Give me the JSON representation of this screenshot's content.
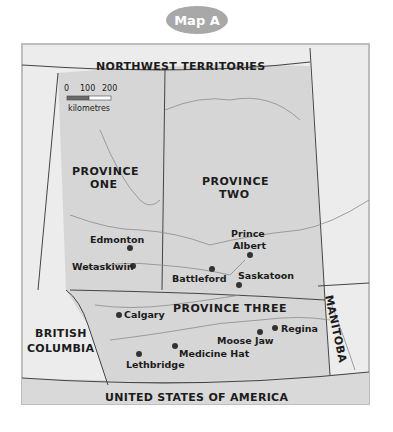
{
  "title": "Map A",
  "colors": {
    "badge": "#a8a8a8",
    "province_fill": "#d6d6d6",
    "outside_fill": "#ececec",
    "border": "#444444",
    "river": "#8a8a8a",
    "city_dot": "#333333"
  },
  "scale_bar": {
    "ticks": [
      "0",
      "100",
      "200"
    ],
    "unit": "kilometres"
  },
  "regions": {
    "north": "NORTHWEST TERRITORIES",
    "west_line1": "BRITISH",
    "west_line2": "COLUMBIA",
    "east": "MANITOBA",
    "south": "UNITED STATES OF AMERICA"
  },
  "provinces": {
    "one_line1": "PROVINCE",
    "one_line2": "ONE",
    "two_line1": "PROVINCE",
    "two_line2": "TWO",
    "three": "PROVINCE THREE"
  },
  "cities": [
    {
      "name": "Edmonton",
      "x": 130,
      "y": 248
    },
    {
      "name": "Wetaskiwin",
      "x": 133,
      "y": 266
    },
    {
      "name": "Battleford",
      "x": 212,
      "y": 269
    },
    {
      "name": "Prince",
      "x": 250,
      "y": 253
    },
    {
      "name": "Albert",
      "x": 250,
      "y": 253
    },
    {
      "name": "Saskatoon",
      "x": 239,
      "y": 284
    },
    {
      "name": "Calgary",
      "x": 119,
      "y": 315
    },
    {
      "name": "Medicine Hat",
      "x": 175,
      "y": 346
    },
    {
      "name": "Lethbridge",
      "x": 139,
      "y": 354
    },
    {
      "name": "Moose Jaw",
      "x": 260,
      "y": 331
    },
    {
      "name": "Regina",
      "x": 275,
      "y": 328
    }
  ]
}
